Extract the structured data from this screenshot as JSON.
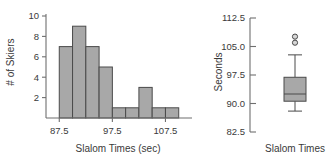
{
  "chart_data": [
    {
      "type": "bar",
      "name": "slalom-times-histogram",
      "title": "",
      "xlabel": "Slalom Times (sec)",
      "ylabel": "# of Skiers",
      "xlim": [
        85.0,
        112.5
      ],
      "ylim": [
        0,
        10
      ],
      "xticks": [
        87.5,
        97.5,
        107.5
      ],
      "xtick_labels": [
        "87.5",
        "97.5",
        "107.5"
      ],
      "yticks": [
        2,
        4,
        6,
        8,
        10
      ],
      "ytick_labels": [
        "2",
        "4",
        "6",
        "8",
        "10"
      ],
      "bin_width": 2.5,
      "bin_edges": [
        87.5,
        90.0,
        92.5,
        95.0,
        97.5,
        100.0,
        102.5,
        105.0,
        107.5,
        110.0
      ],
      "categories": [
        "87.5-90.0",
        "90.0-92.5",
        "92.5-95.0",
        "95.0-97.5",
        "97.5-100.0",
        "100.0-102.5",
        "102.5-105.0",
        "105.0-107.5",
        "107.5-110.0"
      ],
      "values": [
        7,
        9,
        7,
        5,
        1,
        1,
        3,
        1,
        1
      ],
      "grid": false,
      "legend": "none",
      "bar_color": "#a8a8a8",
      "bar_edge_color": "#4a4a4a"
    },
    {
      "type": "box",
      "name": "slalom-times-boxplot",
      "title": "",
      "xlabel": "",
      "ylabel": "Seconds",
      "ylim": [
        82.5,
        112.5
      ],
      "yticks": [
        82.5,
        90.0,
        97.5,
        105.0,
        112.5
      ],
      "ytick_labels": [
        "82.5",
        "90.0",
        "97.5",
        "105.0",
        "112.5"
      ],
      "categories": [
        "Slalom Times"
      ],
      "xtick_labels": [
        "Slalom Times"
      ],
      "box": {
        "label": "Slalom Times",
        "whisker_low": 88.0,
        "q1": 90.6,
        "median": 92.5,
        "q3": 96.9,
        "whisker_high": 102.8,
        "outliers": [
          106.0,
          107.6
        ]
      },
      "grid": false,
      "legend": "none",
      "box_color": "#a8a8a8",
      "box_edge_color": "#4a4a4a"
    }
  ]
}
